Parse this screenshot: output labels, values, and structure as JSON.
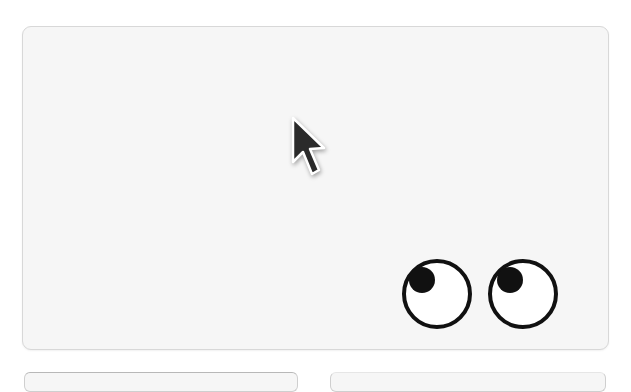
{
  "canvas": {
    "background": "#ffffff",
    "card_background": "#f6f6f6",
    "card_border": "#d8d8d8"
  },
  "cursor": {
    "icon": "arrow-pointer-icon",
    "fill": "#2b2b2b",
    "outline": "#ffffff"
  },
  "eyes": {
    "icon": "googly-eyes-icon",
    "count": 2,
    "gaze": "up-left",
    "sclera": "#ffffff",
    "stroke": "#111111",
    "pupil": "#111111"
  },
  "bottom_cards": [
    {
      "position": "left"
    },
    {
      "position": "right"
    }
  ]
}
